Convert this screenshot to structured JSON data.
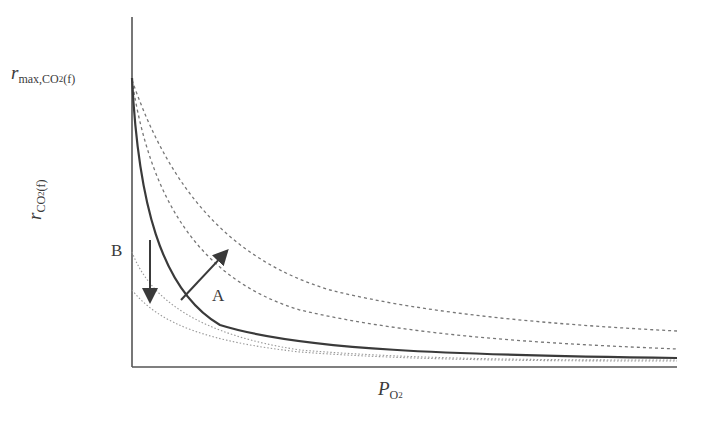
{
  "diagram": {
    "y_axis": {
      "label_var": "r",
      "label_sub": "CO",
      "label_sub2": "2",
      "label_sub_end": "(f)",
      "max_label_var": "r",
      "max_label_sub": "max,CO",
      "max_label_sub2": "2",
      "max_label_sub_end": "(f)"
    },
    "x_axis": {
      "label_var": "P",
      "label_sub": "O",
      "label_sub2": "2"
    },
    "annotations": {
      "a": "A",
      "b": "B"
    },
    "curves": [
      {
        "name": "baseline",
        "style": "solid"
      },
      {
        "name": "shift-a-1",
        "style": "dashed"
      },
      {
        "name": "shift-a-2",
        "style": "dashed"
      },
      {
        "name": "shift-b-1",
        "style": "dotted"
      },
      {
        "name": "shift-b-2",
        "style": "dotted"
      }
    ],
    "colors": {
      "line": "#3a3a3a",
      "dashed": "#777777",
      "dotted": "#999999"
    }
  }
}
